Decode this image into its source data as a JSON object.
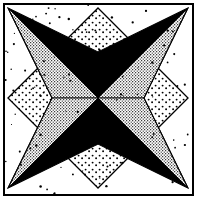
{
  "figure": {
    "width": 197,
    "height": 200,
    "background_color": "#ffffff",
    "ink_color": "#000000",
    "stipple_color": "#111111"
  },
  "frame": {
    "name": "outer-rule",
    "x": 3,
    "y": 3,
    "width": 190,
    "height": 192,
    "stroke_width": 2,
    "stroke_color": "#000000",
    "fill_color": "#ffffff"
  },
  "geometry": {
    "center": {
      "x": 98,
      "y": 98
    },
    "inner_box": {
      "left": 8,
      "top": 8,
      "right": 188,
      "bottom": 188
    },
    "edge_midpoints": {
      "top": {
        "x": 98,
        "y": 8
      },
      "right": {
        "x": 188,
        "y": 98
      },
      "bottom": {
        "x": 98,
        "y": 188
      },
      "left": {
        "x": 8,
        "y": 98
      }
    },
    "corners": {
      "top_left": {
        "x": 8,
        "y": 8
      },
      "top_right": {
        "x": 188,
        "y": 8
      },
      "bottom_right": {
        "x": 188,
        "y": 188
      },
      "bottom_left": {
        "x": 8,
        "y": 188
      }
    },
    "star_waist_radius": 46,
    "diamond_half_diagonal": 48
  },
  "diamonds": [
    {
      "name": "diamond-top",
      "fill": "stipple",
      "cx": 98,
      "cy": 56,
      "half": 48,
      "outline": "#000000"
    },
    {
      "name": "diamond-right",
      "fill": "stipple",
      "cx": 140,
      "cy": 98,
      "half": 48,
      "outline": "#000000"
    },
    {
      "name": "diamond-bottom",
      "fill": "stipple",
      "cx": 98,
      "cy": 140,
      "half": 48,
      "outline": "#000000"
    },
    {
      "name": "diamond-left",
      "fill": "stipple",
      "cx": 56,
      "cy": 98,
      "half": 48,
      "outline": "#000000"
    }
  ],
  "star_rays": [
    {
      "name": "ray-top-left",
      "tip": {
        "x": 8,
        "y": 8
      },
      "upper_half": "black",
      "lower_half": "stipple"
    },
    {
      "name": "ray-top-right",
      "tip": {
        "x": 188,
        "y": 8
      },
      "upper_half": "black",
      "lower_half": "stipple"
    },
    {
      "name": "ray-bottom-right",
      "tip": {
        "x": 188,
        "y": 188
      },
      "upper_half": "black",
      "lower_half": "stipple"
    },
    {
      "name": "ray-bottom-left",
      "tip": {
        "x": 8,
        "y": 188
      },
      "upper_half": "stipple",
      "lower_half": "black"
    }
  ],
  "center_wedges": {
    "count": 8,
    "alternating": true,
    "sequence": [
      "black",
      "stipple",
      "black",
      "stipple",
      "black",
      "stipple",
      "black",
      "stipple"
    ]
  },
  "noise": {
    "name": "scan-speckle",
    "enabled": true,
    "dot_count": 110,
    "dot_radius": 0.9,
    "color": "#000000"
  }
}
